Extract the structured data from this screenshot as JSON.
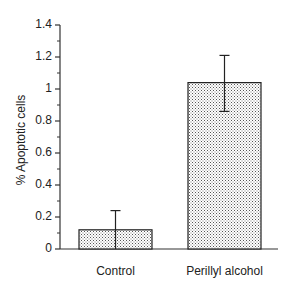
{
  "chart_data": {
    "type": "bar",
    "title": "",
    "xlabel": "",
    "ylabel": "% Apoptotic cells",
    "categories": [
      "Control",
      "Perillyl alcohol"
    ],
    "values": [
      0.12,
      1.04
    ],
    "error_bars": [
      {
        "upper": 0.12,
        "lower": 0.0
      },
      {
        "upper": 0.17,
        "lower": 0.18
      }
    ],
    "ylim": [
      0,
      1.4
    ],
    "yticks": [
      0,
      0.2,
      0.4,
      0.6,
      0.8,
      1,
      1.2,
      1.4
    ],
    "ytick_labels": [
      "0",
      "0.2",
      "0.4",
      "0.6",
      "0.8",
      "1",
      "1.2",
      "1.4"
    ],
    "minor_ticks": true,
    "grid": false,
    "legend": null,
    "bar_fill": "stippled dots"
  },
  "colors": {
    "axis": "#333333",
    "bar_outline": "#222222",
    "bar_dots": "#555555",
    "background": "#ffffff"
  }
}
